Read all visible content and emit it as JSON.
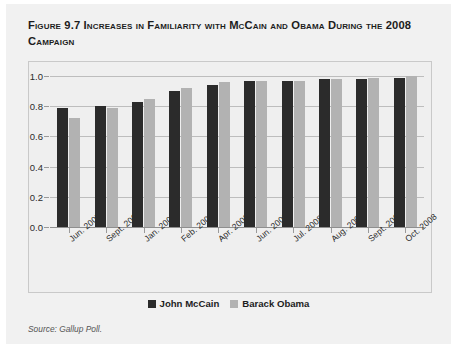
{
  "figure": {
    "title": "Figure 9.7 Increases in Familiarity with McCain and Obama During the 2008 Campaign",
    "source": "Source: Gallup Poll."
  },
  "legend": {
    "items": [
      {
        "label": "John McCain",
        "color": "#2b2b2b"
      },
      {
        "label": "Barack Obama",
        "color": "#b2b2b2"
      }
    ]
  },
  "chart_data": {
    "type": "bar",
    "title": "Figure 9.7 Increases in Familiarity with McCain and Obama During the 2008 Campaign",
    "xlabel": "",
    "ylabel": "",
    "ylim": [
      0.0,
      1.0
    ],
    "yticks": [
      "0.0",
      "0.2",
      "0.4",
      "0.6",
      "0.8",
      "1.0"
    ],
    "ytick_values": [
      0.0,
      0.2,
      0.4,
      0.6,
      0.8,
      1.0
    ],
    "grid": true,
    "legend_position": "bottom-center",
    "source": "Source: Gallup Poll.",
    "categories": [
      "Jun. 2007",
      "Sept. 2007",
      "Jan. 2008",
      "Feb. 2008",
      "Apr. 2008",
      "Jun. 2008",
      "Jul. 2008",
      "Aug. 2008",
      "Sept. 2008",
      "Oct. 2008"
    ],
    "series": [
      {
        "name": "John McCain",
        "color": "#2b2b2b",
        "values": [
          0.79,
          0.8,
          0.83,
          0.9,
          0.94,
          0.97,
          0.97,
          0.98,
          0.98,
          0.99
        ]
      },
      {
        "name": "Barack Obama",
        "color": "#b2b2b2",
        "values": [
          0.72,
          0.79,
          0.85,
          0.92,
          0.96,
          0.97,
          0.97,
          0.98,
          0.99,
          1.0
        ]
      }
    ]
  }
}
